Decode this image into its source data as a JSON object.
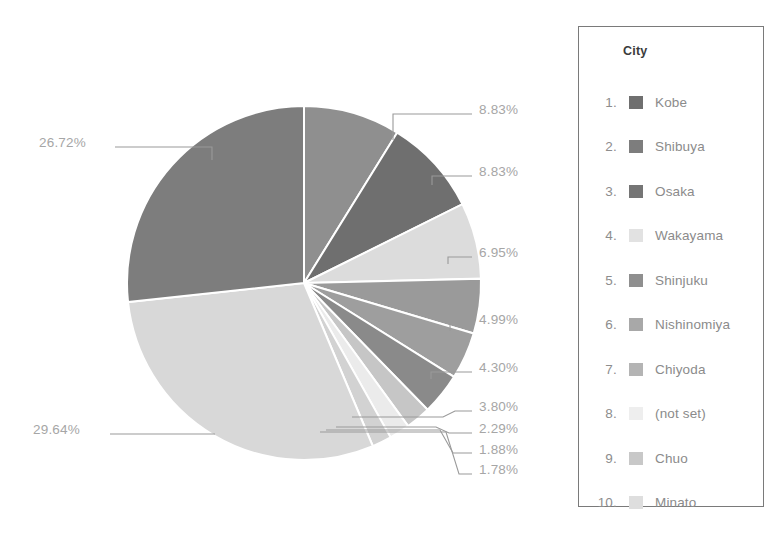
{
  "chart_data": {
    "type": "pie",
    "title": "",
    "dimension_label": "City",
    "legend_position": "right",
    "start_angle_deg": 0,
    "direction": "clockwise",
    "center": {
      "x": 304,
      "y": 283,
      "radius": 177
    },
    "categories": [
      "Kobe",
      "Shibuya",
      "Osaka",
      "Wakayama",
      "Shinjuku",
      "Nishinomiya",
      "Chiyoda",
      "(not set)",
      "Chuo",
      "Minato"
    ],
    "values": [
      29.64,
      26.72,
      8.83,
      8.83,
      6.95,
      4.99,
      4.3,
      3.8,
      2.29,
      1.88
    ],
    "slices": [
      {
        "order": 1,
        "label": "8.83%",
        "value": 8.83,
        "color": "#8f8f8f"
      },
      {
        "order": 2,
        "label": "8.83%",
        "value": 8.83,
        "color": "#6f6f6f"
      },
      {
        "order": 3,
        "label": "6.95%",
        "value": 6.95,
        "color": "#dcdcdc"
      },
      {
        "order": 4,
        "label": "4.99%",
        "value": 4.99,
        "color": "#9a9a9a"
      },
      {
        "order": 5,
        "label": "4.30%",
        "value": 4.3,
        "color": "#9e9e9e"
      },
      {
        "order": 6,
        "label": "3.80%",
        "value": 3.8,
        "color": "#8a8a8a"
      },
      {
        "order": 7,
        "label": "2.29%",
        "value": 2.29,
        "color": "#c6c6c6"
      },
      {
        "order": 8,
        "label": "1.88%",
        "value": 1.88,
        "color": "#ebebeb"
      },
      {
        "order": 9,
        "label": "1.78%",
        "value": 1.78,
        "color": "#d2d2d2"
      },
      {
        "order": 10,
        "label": "29.64%",
        "value": 29.64,
        "color": "#d8d8d8"
      },
      {
        "order": 11,
        "label": "26.72%",
        "value": 26.72,
        "color": "#7d7d7d"
      }
    ],
    "percent_labels": [
      "8.83%",
      "8.83%",
      "6.95%",
      "4.99%",
      "4.30%",
      "3.80%",
      "2.29%",
      "1.88%",
      "1.78%",
      "29.64%",
      "26.72%"
    ]
  },
  "legend": {
    "title": "City",
    "items": [
      {
        "index": "1.",
        "label": "Kobe",
        "color": "#6f6f6f"
      },
      {
        "index": "2.",
        "label": "Shibuya",
        "color": "#7d7d7d"
      },
      {
        "index": "3.",
        "label": "Osaka",
        "color": "#757575"
      },
      {
        "index": "4.",
        "label": "Wakayama",
        "color": "#e2e2e2"
      },
      {
        "index": "5.",
        "label": "Shinjuku",
        "color": "#8f8f8f"
      },
      {
        "index": "6.",
        "label": "Nishinomiya",
        "color": "#a8a8a8"
      },
      {
        "index": "7.",
        "label": "Chiyoda",
        "color": "#b4b4b4"
      },
      {
        "index": "8.",
        "label": "(not set)",
        "color": "#eeeeee"
      },
      {
        "index": "9.",
        "label": "Chuo",
        "color": "#c8c8c8"
      },
      {
        "index": "10.",
        "label": "Minato",
        "color": "#dedede"
      }
    ]
  },
  "colors": {
    "legend_border": "#7a7a7a",
    "label_text": "#a6a6a6",
    "legend_text": "#8b8b8b",
    "title_text": "#3b3b3b",
    "leader_line": "#9a9a9a",
    "background": "#ffffff"
  }
}
